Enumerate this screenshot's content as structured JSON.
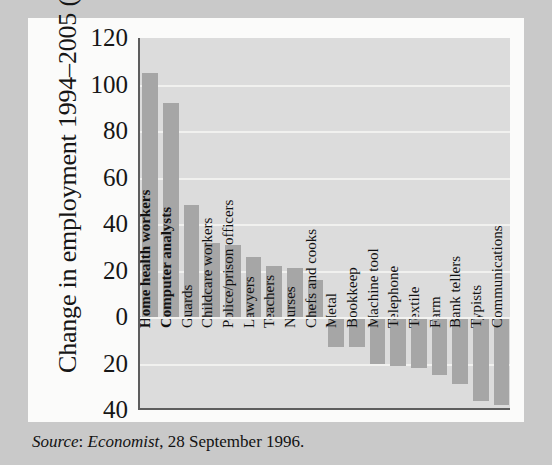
{
  "figure": {
    "y_axis_title": "Change in employment 1994–2005 (%)",
    "source_prefix": "Source",
    "source_publication": "Economist",
    "source_rest": ", 28 September 1996."
  },
  "chart_data": {
    "type": "bar",
    "title": "",
    "xlabel": "",
    "ylabel": "Change in employment 1994–2005 (%)",
    "ylim": [
      -40,
      120
    ],
    "yticks": [
      120,
      100,
      80,
      60,
      40,
      20,
      0,
      -20,
      -40
    ],
    "ytick_labels": [
      "120",
      "100",
      "80",
      "60",
      "40",
      "20",
      "0",
      "20",
      "40"
    ],
    "grid": true,
    "legend": "none",
    "bar_color": "#a6a6a6",
    "plot_bg": "#dcdcdc",
    "categories": [
      "Home health workers",
      "Computer analysts",
      "Guards",
      "Childcare workers",
      "Police/prison officers",
      "Lawyers",
      "Teachers",
      "Nurses",
      "Chefs and cooks",
      "Metal",
      "Bookkeep",
      "Machine tool",
      "Telephone",
      "Textile",
      "Farm",
      "Bank tellers",
      "Typists",
      "Communications"
    ],
    "values": [
      105,
      92,
      48,
      32,
      31,
      26,
      22,
      21,
      16,
      -13,
      -13,
      -20,
      -21,
      -22,
      -25,
      -29,
      -36,
      -38
    ]
  }
}
